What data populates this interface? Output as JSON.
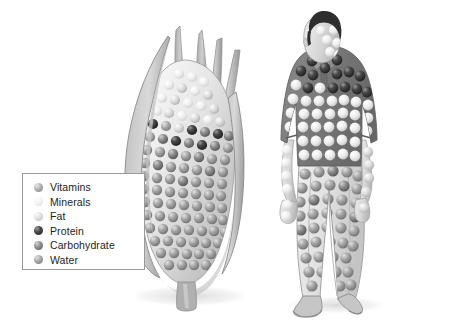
{
  "figure": {
    "background_color": "#ffffff",
    "subjects": [
      {
        "name": "corn-ear",
        "label": ""
      },
      {
        "name": "human-figure",
        "label": ""
      }
    ]
  },
  "legend": {
    "name": "nutrient-legend",
    "border_color": "#9a9a9a",
    "background_color": "#ffffff",
    "items": [
      {
        "label": "Vitamins",
        "color": "#9a9a9a",
        "highlight": "#d8d8d8"
      },
      {
        "label": "Minerals",
        "color": "#e6e6e6",
        "highlight": "#f8f8f8"
      },
      {
        "label": "Fat",
        "color": "#cfcfcf",
        "highlight": "#f0f0f0"
      },
      {
        "label": "Protein",
        "color": "#3a3a3a",
        "highlight": "#8e8e8e"
      },
      {
        "label": "Carbohydrate",
        "color": "#7b7b7b",
        "highlight": "#c2c2c2"
      },
      {
        "label": "Water",
        "color": "#8f8f8f",
        "highlight": "#cccccc"
      }
    ]
  },
  "palette": {
    "husk_light": "#d6d6d6",
    "husk_mid": "#b4b4b4",
    "husk_dark": "#8f8f8f",
    "cob_light": "#f2f2f2",
    "shirt": "#7c7c7c",
    "skin": "#dcdcdc",
    "hair": "#2b2b2b",
    "trousers": "#e3e3e3",
    "shoe": "#bdbdbd",
    "shadow": "#efefef",
    "outline": "#6f6f6f"
  }
}
